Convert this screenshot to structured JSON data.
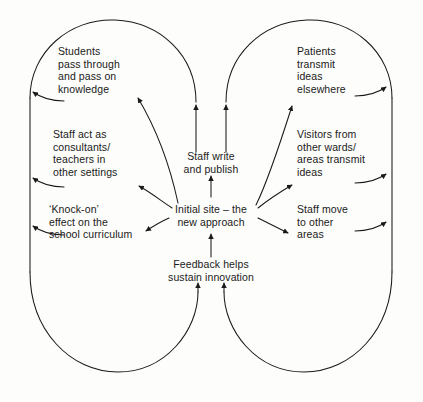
{
  "diagram": {
    "background_color": "#fdfdfb",
    "line_color": "#1a1a1a",
    "text_color": "#1a1a1a",
    "nodes": {
      "center": {
        "id": "initial-site",
        "lines": [
          "Initial site – the",
          "new approach"
        ],
        "text": "Initial site – the\nnew approach"
      },
      "staff_write": {
        "id": "staff-write-and-publish",
        "lines": [
          "Staff write",
          "and publish"
        ],
        "text": "Staff write\nand publish"
      },
      "feedback": {
        "id": "feedback-helps-sustain-innovation",
        "lines": [
          "Feedback helps",
          "sustain innovation"
        ],
        "text": "Feedback helps\nsustain innovation"
      },
      "students": {
        "id": "students-pass-through",
        "lines": [
          "Students",
          "pass through",
          "and pass on",
          "knowledge"
        ],
        "text": "Students\npass through\nand pass on\nknowledge"
      },
      "staff_consultants": {
        "id": "staff-act-as-consultants",
        "lines": [
          "Staff act as",
          "consultants/",
          "teachers in",
          "other settings"
        ],
        "text": "Staff act as\nconsultants/\nteachers in\nother settings"
      },
      "knock_on": {
        "id": "knock-on-effect-school-curriculum",
        "lines": [
          "‘Knock-on’",
          "effect on the",
          "school curriculum"
        ],
        "text": "‘Knock-on’\neffect on the\nschool curriculum"
      },
      "patients": {
        "id": "patients-transmit-ideas-elsewhere",
        "lines": [
          "Patients",
          "transmit",
          "ideas",
          "elsewhere"
        ],
        "text": "Patients\ntransmit\nideas\nelsewhere"
      },
      "visitors": {
        "id": "visitors-from-other-wards",
        "lines": [
          "Visitors from",
          "other wards/",
          "areas transmit",
          "ideas"
        ],
        "text": "Visitors from\nother wards/\nareas transmit\nideas"
      },
      "staff_move": {
        "id": "staff-move-to-other-areas",
        "lines": [
          "Staff move",
          "to other",
          "areas"
        ],
        "text": "Staff move\nto other\nareas"
      }
    }
  }
}
